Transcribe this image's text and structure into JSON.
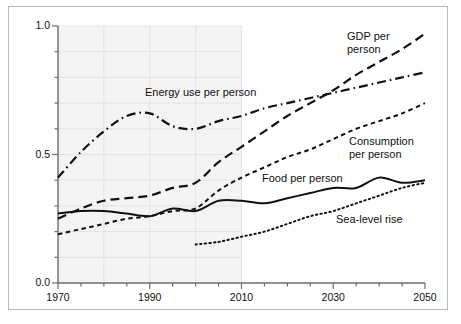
{
  "chart_data": {
    "type": "line",
    "title": "",
    "xlabel": "",
    "ylabel": "",
    "xlim": [
      1970,
      2050
    ],
    "ylim": [
      0.0,
      1.0
    ],
    "grid": true,
    "grid_note": "faint grid shown only over historical region 1970-2010",
    "legend_position": "inline labels next to each curve",
    "x_ticks": [
      "1970",
      "1990",
      "2010",
      "2030",
      "2050"
    ],
    "x_tick_values": [
      1970,
      1990,
      2010,
      2030,
      2050
    ],
    "x_minor_tick_step": 5,
    "y_ticks": [
      "0.0",
      "0.5",
      "1.0"
    ],
    "y_tick_values": [
      0.0,
      0.5,
      1.0
    ],
    "y_minor_tick_step": 0.1,
    "shaded_region": {
      "from": 1970,
      "to": 2010,
      "color": "#f4f4f4"
    },
    "series": [
      {
        "name": "GDP per person",
        "label": "GDP per person",
        "label_lines": [
          "GDP per",
          "person"
        ],
        "style": "long-dash",
        "color": "#111111",
        "x": [
          1970,
          1975,
          1980,
          1985,
          1990,
          1995,
          2000,
          2005,
          2010,
          2015,
          2020,
          2025,
          2030,
          2035,
          2040,
          2045,
          2050
        ],
        "values": [
          0.25,
          0.29,
          0.32,
          0.33,
          0.34,
          0.37,
          0.39,
          0.47,
          0.53,
          0.59,
          0.65,
          0.7,
          0.75,
          0.81,
          0.86,
          0.91,
          0.97
        ]
      },
      {
        "name": "Energy use per person",
        "label": "Energy use per person",
        "label_lines": [
          "Energy use per person"
        ],
        "style": "dash-dot",
        "color": "#111111",
        "x": [
          1970,
          1975,
          1980,
          1985,
          1990,
          1995,
          2000,
          2005,
          2010,
          2015,
          2020,
          2025,
          2030,
          2035,
          2040,
          2045,
          2050
        ],
        "values": [
          0.41,
          0.51,
          0.59,
          0.65,
          0.66,
          0.61,
          0.6,
          0.63,
          0.65,
          0.68,
          0.7,
          0.72,
          0.74,
          0.76,
          0.78,
          0.8,
          0.82
        ]
      },
      {
        "name": "Consumption per person",
        "label": "Consumption per person",
        "label_lines": [
          "Consumption",
          "per person"
        ],
        "style": "short-dash",
        "color": "#111111",
        "x": [
          1970,
          1975,
          1980,
          1985,
          1990,
          1995,
          2000,
          2005,
          2010,
          2015,
          2020,
          2025,
          2030,
          2035,
          2040,
          2045,
          2050
        ],
        "values": [
          0.19,
          0.21,
          0.23,
          0.25,
          0.26,
          0.28,
          0.29,
          0.36,
          0.41,
          0.45,
          0.49,
          0.52,
          0.56,
          0.6,
          0.63,
          0.66,
          0.7
        ]
      },
      {
        "name": "Food per person",
        "label": "Food per person",
        "label_lines": [
          "Food per person"
        ],
        "style": "solid",
        "color": "#111111",
        "x": [
          1970,
          1975,
          1980,
          1985,
          1990,
          1995,
          2000,
          2005,
          2010,
          2015,
          2020,
          2025,
          2030,
          2035,
          2040,
          2045,
          2050
        ],
        "values": [
          0.27,
          0.28,
          0.28,
          0.27,
          0.26,
          0.29,
          0.28,
          0.32,
          0.32,
          0.31,
          0.33,
          0.35,
          0.37,
          0.37,
          0.41,
          0.39,
          0.4
        ]
      },
      {
        "name": "Sea-level rise",
        "label": "Sea-level rise",
        "label_lines": [
          "Sea-level rise"
        ],
        "style": "dotted",
        "color": "#111111",
        "x": [
          2000,
          2005,
          2010,
          2015,
          2020,
          2025,
          2030,
          2035,
          2040,
          2045,
          2050
        ],
        "values": [
          0.15,
          0.16,
          0.18,
          0.2,
          0.23,
          0.26,
          0.28,
          0.31,
          0.34,
          0.37,
          0.39
        ]
      }
    ]
  }
}
